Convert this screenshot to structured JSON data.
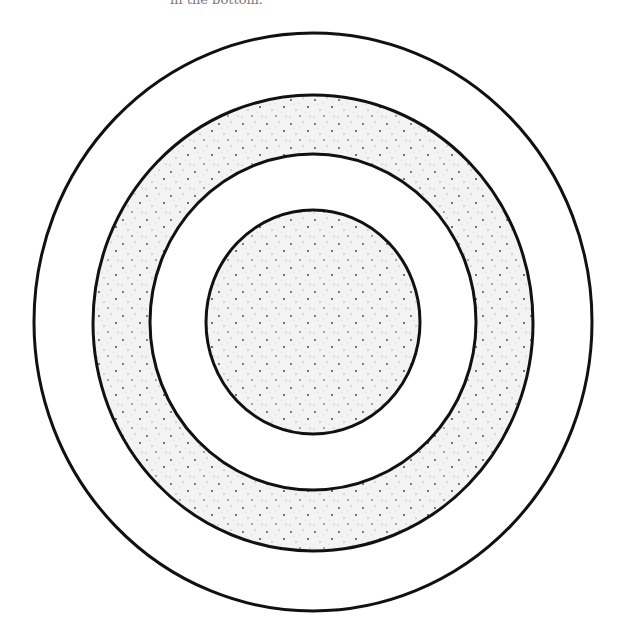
{
  "caption": "in the bottom.",
  "figure": {
    "type": "concentric-circles",
    "stroke_color": "#111111",
    "fill_stipple_color": "#f2f2f2",
    "dot_color": "#555555",
    "rings": [
      {
        "name": "outer",
        "cx": 313,
        "cy": 322,
        "rx": 279,
        "ry": 289,
        "fill": "plain"
      },
      {
        "name": "second",
        "cx": 313,
        "cy": 323,
        "rx": 220,
        "ry": 228,
        "fill": "stippled"
      },
      {
        "name": "third",
        "cx": 313,
        "cy": 322,
        "rx": 163,
        "ry": 168,
        "fill": "plain"
      },
      {
        "name": "inner",
        "cx": 313,
        "cy": 322,
        "rx": 107,
        "ry": 112,
        "fill": "stippled"
      }
    ]
  }
}
